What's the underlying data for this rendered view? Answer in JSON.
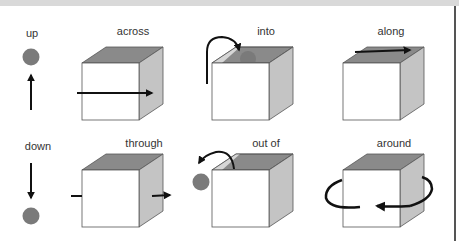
{
  "colors": {
    "cube_top": "#8a8a8a",
    "cube_side": "#c4c4c4",
    "cube_front": "#ffffff",
    "ball": "#7a7a7a",
    "arrow": "#111111"
  },
  "items": [
    {
      "label": "up"
    },
    {
      "label": "across"
    },
    {
      "label": "into"
    },
    {
      "label": "along"
    },
    {
      "label": "down"
    },
    {
      "label": "through"
    },
    {
      "label": "out of"
    },
    {
      "label": "around"
    }
  ]
}
